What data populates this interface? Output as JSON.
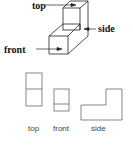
{
  "diagram": {
    "isometric_labels": {
      "top": "top",
      "side": "side",
      "front": "front"
    },
    "view_labels": {
      "top": "top",
      "front": "front",
      "side": "side"
    }
  }
}
